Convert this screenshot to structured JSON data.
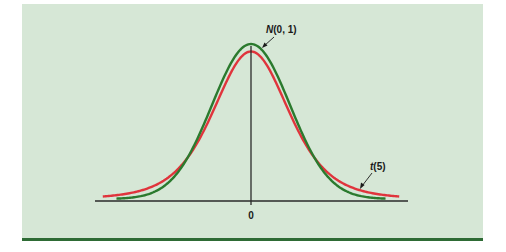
{
  "chart_data": {
    "type": "line",
    "title": "",
    "xlabel": "",
    "ylabel": "",
    "x_ticks": [
      "0"
    ],
    "xlim": [
      -4,
      4
    ],
    "grid": false,
    "legend": "inline annotations with arrows",
    "series": [
      {
        "name": "N(0, 1)",
        "color": "#2b7a2e",
        "pdf": "standard normal",
        "x_range": [
          -3.45,
          3.45
        ],
        "peak_density": 0.3989
      },
      {
        "name": "t(5)",
        "color": "#e0343c",
        "pdf": "Student t, 5 degrees of freedom",
        "x_range": [
          -3.8,
          3.8
        ],
        "peak_density": 0.3796
      }
    ],
    "annotations": [
      {
        "text_main": "N",
        "text_rest": "(0, 1)",
        "target_series": "N(0, 1)",
        "position": "near peak, upper right"
      },
      {
        "text_main": "t",
        "text_rest": "(5)",
        "target_series": "t(5)",
        "position": "right tail"
      }
    ],
    "layout": {
      "center_px": 251,
      "baseline_px": 201,
      "px_per_unit": 39,
      "normal_peak_height_px": 155
    },
    "colors": {
      "panel": "#d6e7d6",
      "axis": "#2a2a2a",
      "rule": "#2e6b35"
    }
  },
  "labels": {
    "zero_tick": "0",
    "normal_main": "N",
    "normal_rest": "(0, 1)",
    "t_main": "t",
    "t_rest": "(5)"
  }
}
